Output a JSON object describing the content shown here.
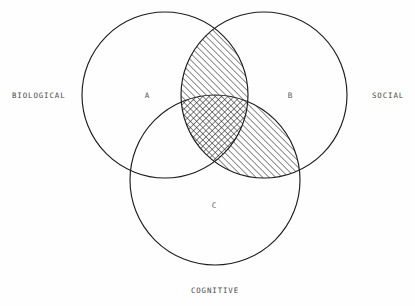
{
  "diagram": {
    "type": "venn",
    "title_visible": false,
    "background_color": "#fefefe",
    "stroke_color": "#1d1d1d",
    "text_color": "#4a4a4a",
    "outer_labels": [
      {
        "id": "biological",
        "text": "BIOLOGICAL",
        "x": 12,
        "y": 98,
        "anchor": "start"
      },
      {
        "id": "social",
        "text": "SOCIAL",
        "x": 372,
        "y": 98,
        "anchor": "start"
      },
      {
        "id": "cognitive",
        "text": "COGNITIVE",
        "x": 215,
        "y": 293,
        "anchor": "middle"
      }
    ],
    "region_labels": [
      {
        "id": "region-a",
        "text": "A",
        "x": 147,
        "y": 98
      },
      {
        "id": "region-b",
        "text": "B",
        "x": 290,
        "y": 98
      },
      {
        "id": "region-c",
        "text": "C",
        "x": 214,
        "y": 208
      }
    ],
    "circles": [
      {
        "id": "circle-biological",
        "label": "BIOLOGICAL",
        "cx": 165,
        "cy": 95,
        "r": 83
      },
      {
        "id": "circle-social",
        "label": "SOCIAL",
        "cx": 264,
        "cy": 95,
        "r": 83
      },
      {
        "id": "circle-cognitive",
        "label": "COGNITIVE",
        "cx": 215,
        "cy": 180,
        "r": 85
      }
    ],
    "shaded_regions": [
      {
        "id": "overlap-a-b",
        "sets": [
          "BIOLOGICAL",
          "SOCIAL"
        ],
        "fill": "diagonal-hatch"
      },
      {
        "id": "overlap-b-c",
        "sets": [
          "SOCIAL",
          "COGNITIVE"
        ],
        "fill": "diagonal-hatch"
      },
      {
        "id": "overlap-a-b-c",
        "sets": [
          "BIOLOGICAL",
          "SOCIAL",
          "COGNITIVE"
        ],
        "fill": "cross-hatch"
      }
    ],
    "unshaded_regions": [
      {
        "id": "only-a",
        "label": "A"
      },
      {
        "id": "only-b",
        "label": "B"
      },
      {
        "id": "only-c",
        "label": "C"
      }
    ]
  }
}
